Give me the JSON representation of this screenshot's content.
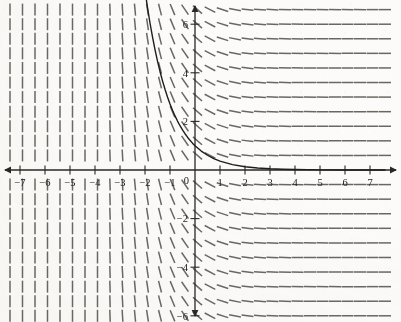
{
  "figure": {
    "title": "",
    "width": 401,
    "height": 322
  },
  "chart_data": {
    "type": "line",
    "title": "",
    "xlabel": "",
    "ylabel": "",
    "xlim": [
      -7.8,
      7.8
    ],
    "ylim": [
      -7.1,
      6.9
    ],
    "grid": false,
    "legend": null,
    "axes": {
      "origin_px": [
        195,
        170
      ],
      "px_per_unit_x": 25.0,
      "px_per_unit_y": 24.3,
      "x_ticks": [
        -7,
        -6,
        -5,
        -4,
        -3,
        -2,
        -1,
        1,
        2,
        3,
        4,
        5,
        6,
        7
      ],
      "x_tick_labels": [
        "−7",
        "−6",
        "−5",
        "−4",
        "−3",
        "−2",
        "−1",
        "1",
        "2",
        "3",
        "4",
        "5",
        "6",
        "7"
      ],
      "y_ticks": [
        -6,
        -4,
        -2,
        2,
        4,
        6
      ],
      "y_tick_labels": [
        "−6",
        "−4",
        "−2",
        "2",
        "4",
        "6"
      ],
      "origin_label": "0",
      "x_axis_arrows": [
        "left",
        "right"
      ],
      "y_axis_arrows": [
        "up",
        "down"
      ],
      "axis_color": "#2a2724"
    },
    "slope_field": {
      "description": "dash segments whose slope depends only on x",
      "slope_formula": "dy/dx = -exp(-x)",
      "x_samples": [
        -7.4,
        -6.9,
        -6.4,
        -5.9,
        -5.4,
        -4.9,
        -4.4,
        -3.9,
        -3.4,
        -2.9,
        -2.4,
        -1.9,
        -1.4,
        -0.9,
        -0.4,
        0.1,
        0.6,
        1.1,
        1.6,
        2.1,
        2.6,
        3.1,
        3.6,
        4.1,
        4.6,
        5.1,
        5.6,
        6.1,
        6.6,
        7.1,
        7.6
      ],
      "y_samples": [
        -6.6,
        -6.0,
        -5.4,
        -4.8,
        -4.2,
        -3.6,
        -3.0,
        -2.4,
        -1.8,
        -1.2,
        -0.6,
        0.6,
        1.2,
        1.8,
        2.4,
        3.0,
        3.6,
        4.2,
        4.8,
        5.4,
        6.0,
        6.6
      ],
      "dash_length_px": 12,
      "dash_color": "#57524d"
    },
    "series": [
      {
        "name": "solution curve",
        "equation": "y = e^(-x)",
        "color": "#1f1c1a",
        "linewidth": 1.4,
        "points": [
          {
            "x": -2.0,
            "y": 7.389
          },
          {
            "x": -1.9,
            "y": 6.686
          },
          {
            "x": -1.8,
            "y": 6.05
          },
          {
            "x": -1.7,
            "y": 5.474
          },
          {
            "x": -1.6,
            "y": 4.953
          },
          {
            "x": -1.5,
            "y": 4.482
          },
          {
            "x": -1.4,
            "y": 4.055
          },
          {
            "x": -1.3,
            "y": 3.669
          },
          {
            "x": -1.2,
            "y": 3.32
          },
          {
            "x": -1.1,
            "y": 3.004
          },
          {
            "x": -1.0,
            "y": 2.718
          },
          {
            "x": -0.9,
            "y": 2.46
          },
          {
            "x": -0.8,
            "y": 2.226
          },
          {
            "x": -0.7,
            "y": 2.014
          },
          {
            "x": -0.6,
            "y": 1.822
          },
          {
            "x": -0.5,
            "y": 1.649
          },
          {
            "x": -0.4,
            "y": 1.492
          },
          {
            "x": -0.3,
            "y": 1.35
          },
          {
            "x": -0.2,
            "y": 1.221
          },
          {
            "x": -0.1,
            "y": 1.105
          },
          {
            "x": 0.0,
            "y": 1.0
          },
          {
            "x": 0.25,
            "y": 0.779
          },
          {
            "x": 0.5,
            "y": 0.607
          },
          {
            "x": 0.75,
            "y": 0.472
          },
          {
            "x": 1.0,
            "y": 0.368
          },
          {
            "x": 1.5,
            "y": 0.223
          },
          {
            "x": 2.0,
            "y": 0.135
          },
          {
            "x": 2.5,
            "y": 0.082
          },
          {
            "x": 3.0,
            "y": 0.05
          },
          {
            "x": 3.5,
            "y": 0.03
          },
          {
            "x": 4.0,
            "y": 0.018
          },
          {
            "x": 5.0,
            "y": 0.007
          },
          {
            "x": 6.0,
            "y": 0.002
          },
          {
            "x": 7.0,
            "y": 0.001
          },
          {
            "x": 7.6,
            "y": 0.0005
          }
        ]
      }
    ]
  }
}
